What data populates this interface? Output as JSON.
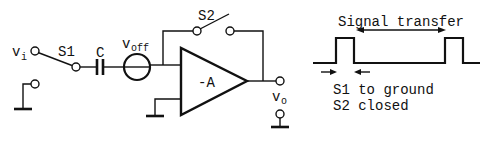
{
  "circuit": {
    "input_label": "v",
    "input_subscript": "i",
    "switch1_label": "S1",
    "capacitor_label": "C",
    "offset_source_label": "v",
    "offset_source_subscript": "off",
    "switch2_label": "S2",
    "amplifier_label": "-A",
    "output_label": "v",
    "output_subscript": "o"
  },
  "timing": {
    "signal_transfer_label": "Signal transfer",
    "note_line1": "S1 to ground",
    "note_line2": "S2 closed"
  }
}
